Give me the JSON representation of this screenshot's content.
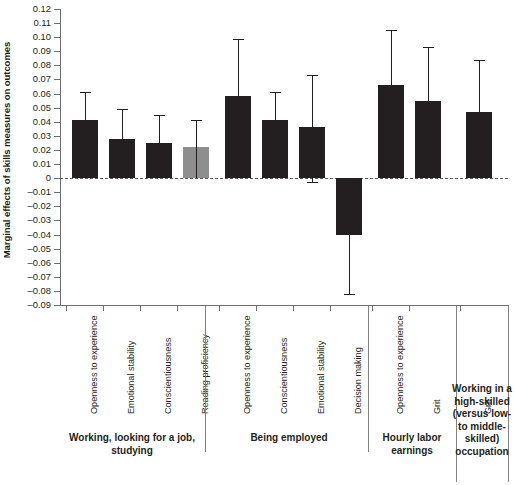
{
  "chart_data": {
    "type": "bar",
    "title": "",
    "subtitle": "",
    "xlabel": "",
    "ylabel": "Marginal effects of skills measures on outcomes",
    "ylim": [
      -0.09,
      0.12
    ],
    "ytick_step": 0.01,
    "ytick_labels": [
      "0.12",
      "0.11",
      "0.10",
      "0.09",
      "0.08",
      "0.07",
      "0.06",
      "0.05",
      "0.04",
      "0.03",
      "0.02",
      "0.01",
      "0",
      "–0.01",
      "–0.02",
      "–0.03",
      "–0.04",
      "–0.05",
      "–0.06",
      "–0.07",
      "–0.08",
      "–0.09"
    ],
    "ytick_values": [
      0.12,
      0.11,
      0.1,
      0.09,
      0.08,
      0.07,
      0.06,
      0.05,
      0.04,
      0.03,
      0.02,
      0.01,
      0,
      -0.01,
      -0.02,
      -0.03,
      -0.04,
      -0.05,
      -0.06,
      -0.07,
      -0.08,
      -0.09
    ],
    "grid": false,
    "legend": "none",
    "zero_reference_line": true,
    "bar_color": "#231f20",
    "highlight_bar_color": "#8e8e8e",
    "error_bar_note": "vertical whiskers with caps show confidence intervals",
    "categories": [
      "Openness to experience",
      "Emotional stability",
      "Conscientiousness",
      "Reading proficiency",
      "Openness to experience",
      "Conscientiousness",
      "Emotional stability",
      "Decision making",
      "Openness to experience",
      "Grit",
      "Grit"
    ],
    "values": [
      0.041,
      0.028,
      0.025,
      0.022,
      0.058,
      0.041,
      0.036,
      -0.04,
      0.066,
      0.055,
      0.047
    ],
    "ci_low": [
      0.0,
      0.0,
      0.0,
      0.0,
      0.0,
      0.0,
      -0.003,
      -0.082,
      0.0,
      0.0,
      0.0
    ],
    "ci_high": [
      0.061,
      0.049,
      0.045,
      0.041,
      0.099,
      0.061,
      0.073,
      -0.001,
      0.105,
      0.093,
      0.084
    ],
    "colors": [
      "dark",
      "dark",
      "dark",
      "gray",
      "dark",
      "dark",
      "dark",
      "dark",
      "dark",
      "dark",
      "dark"
    ],
    "groups": [
      {
        "label": "Working, looking for a job, studying",
        "categories": [
          0,
          1,
          2,
          3
        ]
      },
      {
        "label": "Being employed",
        "categories": [
          4,
          5,
          6,
          7
        ]
      },
      {
        "label": "Hourly labor earnings",
        "categories": [
          8,
          9
        ]
      },
      {
        "label": "Working in a high-skilled (versus low- to middle-skilled) occupation",
        "categories": [
          10
        ]
      }
    ]
  }
}
